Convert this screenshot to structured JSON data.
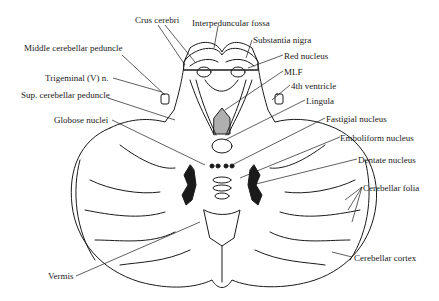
{
  "figure": {
    "colors": {
      "ink": "#1a1a1a",
      "background": "#ffffff"
    },
    "labels": {
      "crus_cerebri": "Crus cerebri",
      "interpeduncular_fossa": "Interpeduncular fossa",
      "substantia_nigra": "Substantia nigra",
      "red_nucleus": "Red nucleus",
      "mlf": "MLF",
      "fourth_ventricle": "4th ventricle",
      "lingula": "Lingula",
      "fastigial_nucleus": "Fastigial nucleus",
      "emboliform_nucleus": "Emboliform nucleus",
      "dentate_nucleus": "Dentate nucleus",
      "cerebellar_folia": "Cerebellar folia",
      "cerebellar_cortex": "Cerebellar cortex",
      "middle_cerebellar_peduncle": "Middle cerebellar peduncle",
      "trigeminal_nerve": "Trigeminal (V) n.",
      "sup_cerebellar_peduncle": "Sup. cerebellar peduncle",
      "globose_nuclei": "Globose nuclei",
      "vermis": "Vermis"
    }
  }
}
